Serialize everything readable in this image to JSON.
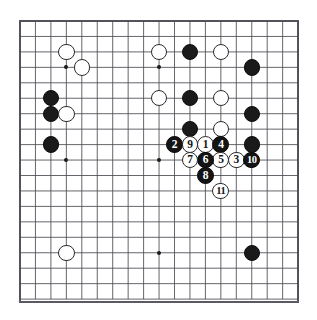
{
  "diagram": {
    "board_size": 19,
    "frame_color": "#5a5a64",
    "line_color": "#4a4a52",
    "black_color": "#1a1a1a",
    "white_color": "#ffffff",
    "background": "#ffffff"
  },
  "geometry": {
    "origin_x": 20,
    "origin_y": 21,
    "spacing": 15.45,
    "stone_radius": 8.2,
    "move_radius": 8.4,
    "hoshi_radius": 1.9
  },
  "hoshi_points": [
    {
      "col": 3,
      "row": 3
    },
    {
      "col": 9,
      "row": 3
    },
    {
      "col": 15,
      "row": 3
    },
    {
      "col": 3,
      "row": 9
    },
    {
      "col": 9,
      "row": 9
    },
    {
      "col": 15,
      "row": 9
    },
    {
      "col": 3,
      "row": 15
    },
    {
      "col": 9,
      "row": 15
    },
    {
      "col": 15,
      "row": 15
    }
  ],
  "stones": [
    {
      "col": 3,
      "row": 2,
      "color": "white"
    },
    {
      "col": 4,
      "row": 3,
      "color": "white"
    },
    {
      "col": 2,
      "row": 5,
      "color": "black"
    },
    {
      "col": 2,
      "row": 6,
      "color": "black"
    },
    {
      "col": 3,
      "row": 6,
      "color": "white"
    },
    {
      "col": 2,
      "row": 8,
      "color": "black"
    },
    {
      "col": 9,
      "row": 2,
      "color": "white"
    },
    {
      "col": 9,
      "row": 5,
      "color": "white"
    },
    {
      "col": 11,
      "row": 2,
      "color": "black"
    },
    {
      "col": 11,
      "row": 5,
      "color": "black"
    },
    {
      "col": 11,
      "row": 7,
      "color": "black"
    },
    {
      "col": 13,
      "row": 2,
      "color": "white"
    },
    {
      "col": 13,
      "row": 5,
      "color": "white"
    },
    {
      "col": 13,
      "row": 7,
      "color": "white"
    },
    {
      "col": 15,
      "row": 3,
      "color": "black"
    },
    {
      "col": 15,
      "row": 6,
      "color": "black"
    },
    {
      "col": 15,
      "row": 8,
      "color": "black"
    },
    {
      "col": 3,
      "row": 15,
      "color": "white"
    },
    {
      "col": 15,
      "row": 15,
      "color": "black"
    }
  ],
  "moves": [
    {
      "number": "1",
      "col": 12,
      "row": 8,
      "color": "white"
    },
    {
      "number": "2",
      "col": 10,
      "row": 8,
      "color": "black"
    },
    {
      "number": "3",
      "col": 14,
      "row": 9,
      "color": "white"
    },
    {
      "number": "4",
      "col": 13,
      "row": 8,
      "color": "black"
    },
    {
      "number": "5",
      "col": 13,
      "row": 9,
      "color": "white"
    },
    {
      "number": "6",
      "col": 12,
      "row": 9,
      "color": "black"
    },
    {
      "number": "7",
      "col": 11,
      "row": 9,
      "color": "white"
    },
    {
      "number": "8",
      "col": 12,
      "row": 10,
      "color": "black"
    },
    {
      "number": "9",
      "col": 11,
      "row": 8,
      "color": "white"
    },
    {
      "number": "10",
      "col": 15,
      "row": 9,
      "color": "black"
    },
    {
      "number": "11",
      "col": 13,
      "row": 11,
      "color": "white"
    }
  ]
}
